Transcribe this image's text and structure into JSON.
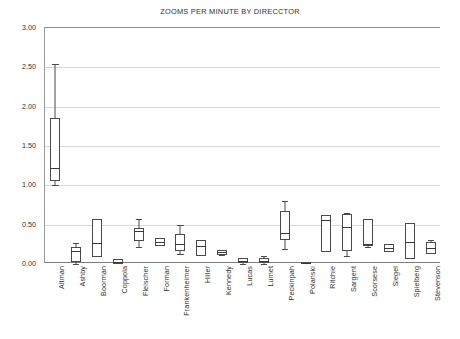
{
  "chart_data": {
    "type": "box",
    "title": "ZOOMS PER MINUTE BY DIRECCTOR",
    "xlabel": "",
    "ylabel": "",
    "ylim": [
      0.0,
      3.0
    ],
    "ytick_labels": [
      "0.00",
      "0.50",
      "1.00",
      "1.50",
      "2.00",
      "2.50",
      "3.00"
    ],
    "ytick_values": [
      0.0,
      0.5,
      1.0,
      1.5,
      2.0,
      2.5,
      3.0
    ],
    "grid": "horizontal",
    "legend": "none",
    "categories": [
      "Altman",
      "Ashby",
      "Boorman",
      "Coppola",
      "Fleischer",
      "Forman",
      "Frankenheimer",
      "Hiller",
      "Kennedy",
      "Lucas",
      "Lumet",
      "Peckinpah",
      "Polanski",
      "Ritchie",
      "Sargent",
      "Scorsese",
      "Siegel",
      "Spielberg",
      "Stevenson"
    ],
    "boxes": [
      {
        "label": "Altman",
        "min": 1.0,
        "q1": 1.05,
        "median": 1.22,
        "q3": 1.85,
        "max": 2.54
      },
      {
        "label": "Ashby",
        "min": 0.0,
        "q1": 0.02,
        "median": 0.16,
        "q3": 0.22,
        "max": 0.27
      },
      {
        "label": "Boorman",
        "min": 0.09,
        "q1": 0.09,
        "median": 0.27,
        "q3": 0.57,
        "max": 0.57
      },
      {
        "label": "Coppola",
        "min": 0.0,
        "q1": 0.0,
        "median": 0.03,
        "q3": 0.06,
        "max": 0.06
      },
      {
        "label": "Fleischer",
        "min": 0.22,
        "q1": 0.29,
        "median": 0.42,
        "q3": 0.46,
        "max": 0.57
      },
      {
        "label": "Forman",
        "min": 0.23,
        "q1": 0.23,
        "median": 0.28,
        "q3": 0.33,
        "max": 0.33
      },
      {
        "label": "Frankenheimer",
        "min": 0.13,
        "q1": 0.17,
        "median": 0.25,
        "q3": 0.38,
        "max": 0.5
      },
      {
        "label": "Hiller",
        "min": 0.1,
        "q1": 0.1,
        "median": 0.23,
        "q3": 0.31,
        "max": 0.31
      },
      {
        "label": "Kennedy",
        "min": 0.11,
        "q1": 0.12,
        "median": 0.15,
        "q3": 0.18,
        "max": 0.18
      },
      {
        "label": "Lucas",
        "min": 0.0,
        "q1": 0.01,
        "median": 0.04,
        "q3": 0.07,
        "max": 0.07
      },
      {
        "label": "Lumet",
        "min": 0.0,
        "q1": 0.01,
        "median": 0.04,
        "q3": 0.07,
        "max": 0.1
      },
      {
        "label": "Peckinpah",
        "min": 0.19,
        "q1": 0.3,
        "median": 0.4,
        "q3": 0.67,
        "max": 0.8
      },
      {
        "label": "Polanski",
        "min": 0.0,
        "q1": 0.0,
        "median": 0.01,
        "q3": 0.02,
        "max": 0.02
      },
      {
        "label": "Ritchie",
        "min": 0.15,
        "q1": 0.15,
        "median": 0.56,
        "q3": 0.62,
        "max": 0.62
      },
      {
        "label": "Sargent",
        "min": 0.1,
        "q1": 0.17,
        "median": 0.47,
        "q3": 0.63,
        "max": 0.65
      },
      {
        "label": "Scorsese",
        "min": 0.22,
        "q1": 0.23,
        "median": 0.26,
        "q3": 0.57,
        "max": 0.57
      },
      {
        "label": "Siegel",
        "min": 0.15,
        "q1": 0.15,
        "median": 0.2,
        "q3": 0.25,
        "max": 0.25
      },
      {
        "label": "Spielberg",
        "min": 0.06,
        "q1": 0.06,
        "median": 0.28,
        "q3": 0.52,
        "max": 0.52
      },
      {
        "label": "Stevenson",
        "min": 0.13,
        "q1": 0.13,
        "median": 0.2,
        "q3": 0.28,
        "max": 0.3
      }
    ]
  },
  "style": {
    "line_color": "#4a4a4a",
    "grid_color": "#d8d8d8",
    "text_color": "#2f2f2f",
    "background": "#ffffff"
  }
}
